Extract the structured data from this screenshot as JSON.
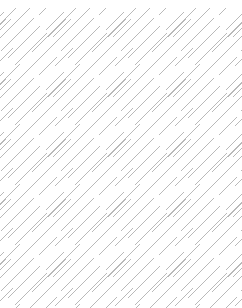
{
  "page": {
    "width": 242,
    "height": 308,
    "background_color": "#ffffff"
  },
  "pattern": {
    "name": "diagonal-hatch-texture",
    "description": "Seamless decorative texture of light gray 45 degree diagonal strokes running from lower-left to upper-right",
    "stroke_color": "#b9b9b9",
    "stroke_width": 1,
    "stroke_angle_degrees": 45,
    "stroke_direction": "lower-left-to-upper-right",
    "tile_size": 60,
    "tile_repeat_x": 60,
    "tile_repeat_y": 60,
    "top_margin": 8,
    "strokes": [
      {
        "x1": 2,
        "y1": 22,
        "x2": 20,
        "y2": 4
      },
      {
        "x1": 9,
        "y1": 29,
        "x2": 27,
        "y2": 11
      },
      {
        "x1": 16,
        "y1": 36,
        "x2": 34,
        "y2": 18
      },
      {
        "x1": -6,
        "y1": 44,
        "x2": 26,
        "y2": 12
      },
      {
        "x1": 1,
        "y1": 51,
        "x2": 33,
        "y2": 19
      },
      {
        "x1": 8,
        "y1": 58,
        "x2": 40,
        "y2": 26
      },
      {
        "x1": 15,
        "y1": 65,
        "x2": 47,
        "y2": 33
      },
      {
        "x1": 32,
        "y1": 52,
        "x2": 64,
        "y2": 20
      },
      {
        "x1": 39,
        "y1": 59,
        "x2": 71,
        "y2": 27
      },
      {
        "x1": 46,
        "y1": 30,
        "x2": 64,
        "y2": 12
      },
      {
        "x1": 53,
        "y1": 37,
        "x2": 71,
        "y2": 19
      },
      {
        "x1": 39,
        "y1": 15,
        "x2": 57,
        "y2": -3
      },
      {
        "x1": 25,
        "y1": 73,
        "x2": 43,
        "y2": 55
      },
      {
        "x1": -12,
        "y1": 37,
        "x2": 6,
        "y2": 19
      },
      {
        "x1": -5,
        "y1": 66,
        "x2": 13,
        "y2": 48
      }
    ]
  }
}
